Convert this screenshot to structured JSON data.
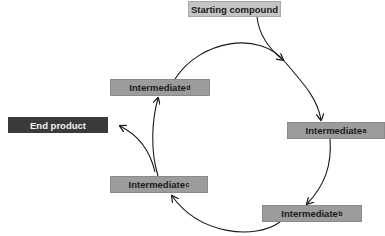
{
  "diagram": {
    "type": "cycle",
    "nodes": {
      "starting_compound": {
        "label": "Starting compound"
      },
      "intermediate_a": {
        "label": "Intermediate",
        "subscript": "a"
      },
      "intermediate_b": {
        "label": "Intermediate",
        "subscript": "b"
      },
      "intermediate_c": {
        "label": "Intermediate",
        "subscript": "c"
      },
      "intermediate_d": {
        "label": "Intermediate",
        "subscript": "d"
      },
      "end_product": {
        "label": "End product"
      }
    },
    "edges": [
      {
        "from": "Starting compound",
        "to": "cycle (before Intermediate a)"
      },
      {
        "from": "Intermediate d",
        "to": "Intermediate a"
      },
      {
        "from": "Intermediate a",
        "to": "Intermediate b"
      },
      {
        "from": "Intermediate b",
        "to": "Intermediate c"
      },
      {
        "from": "Intermediate c",
        "to": "Intermediate d"
      },
      {
        "from": "Intermediate c",
        "to": "End product"
      }
    ],
    "colors": {
      "intermediate_fill": "#9c9c9c",
      "start_fill": "#c4c4c4",
      "end_fill": "#3a3a3a",
      "end_text": "#f2f2f2",
      "arrow": "#1a1a1a"
    }
  }
}
